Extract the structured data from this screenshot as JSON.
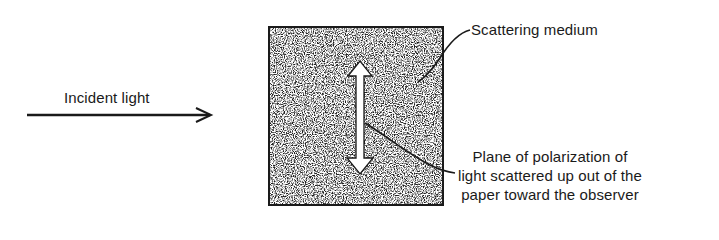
{
  "diagram": {
    "labels": {
      "incident_light": "Incident light",
      "scattering_medium": "Scattering medium",
      "polarization_line1": "Plane of polarization of",
      "polarization_line2": "light scattered up out of the",
      "polarization_line3": "paper toward the observer"
    },
    "colors": {
      "ink": "#1a1a1a",
      "medium_fill": "#8a8a8a",
      "background": "#ffffff",
      "polarization_arrow": "#ffffff"
    },
    "elements": {
      "incident_arrow": "right-arrow",
      "medium_box": "stippled-square",
      "polarization_arrow": "double-headed-vertical-arrow"
    }
  }
}
